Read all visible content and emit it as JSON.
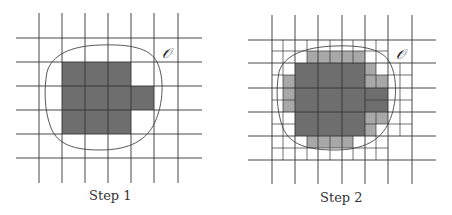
{
  "figure": {
    "colors": {
      "grid": "#333333",
      "dark_fill": "#6e6e6e",
      "light_fill": "#a8a8a8",
      "boundary": "#444444",
      "background": "#ffffff"
    },
    "panels": [
      {
        "id": "step1",
        "caption": "Step 1",
        "set_label": "𝒪",
        "grid": {
          "x": [
            39,
            62,
            85,
            108,
            131,
            154,
            178
          ],
          "y": [
            38,
            62,
            86,
            110,
            134,
            158
          ],
          "x_span": [
            16,
            202
          ],
          "y_span": [
            13,
            183
          ]
        },
        "dark_cells": [
          [
            62,
            62,
            69,
            72
          ],
          [
            131,
            86,
            23,
            24
          ]
        ],
        "light_cells": [],
        "fine_lines": []
      },
      {
        "id": "step2",
        "caption": "Step 2",
        "set_label": "𝒪",
        "grid": {
          "x": [
            272,
            295,
            318,
            342,
            365,
            388,
            412
          ],
          "y": [
            40,
            63,
            88,
            112,
            136,
            160
          ],
          "x_span": [
            248,
            436
          ],
          "y_span": [
            15,
            184
          ]
        },
        "dark_cells": [
          [
            295,
            63,
            70,
            73
          ],
          [
            365,
            88,
            23,
            24
          ]
        ],
        "light_cells": [
          [
            307,
            51,
            58,
            12
          ],
          [
            283,
            75,
            12,
            37
          ],
          [
            307,
            136,
            46,
            12
          ],
          [
            365,
            63,
            11,
            25
          ],
          [
            376,
            75,
            12,
            13
          ],
          [
            365,
            112,
            23,
            12
          ],
          [
            365,
            124,
            11,
            12
          ]
        ]
      }
    ]
  }
}
